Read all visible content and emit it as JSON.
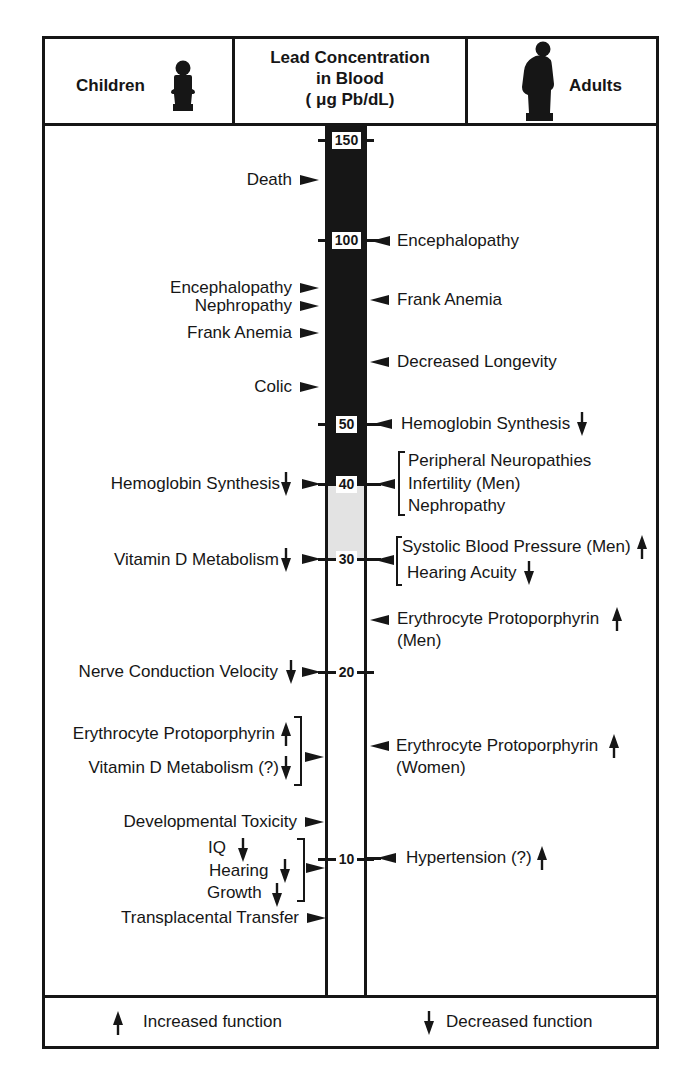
{
  "header": {
    "children_label": "Children",
    "title": [
      "Lead Concentration",
      "in Blood",
      "( μg Pb/dL)"
    ],
    "adults_label": "Adults",
    "children_icon": "child-figure-icon",
    "adults_icon": "adult-figure-icon"
  },
  "scale": {
    "unit": "μg Pb/dL",
    "ticks": [
      "150",
      "100",
      "50",
      "40",
      "30",
      "20",
      "10"
    ],
    "fill": {
      "black_range": "above 40",
      "gray_range": "30-40"
    }
  },
  "children": {
    "effects": [
      {
        "label": "Death",
        "function": "",
        "level_approx": 125
      },
      {
        "label": "Encephalopathy",
        "function": "",
        "level_approx": 85
      },
      {
        "label": "Nephropathy",
        "function": "",
        "level_approx": 80
      },
      {
        "label": "Frank Anemia",
        "function": "",
        "level_approx": 70
      },
      {
        "label": "Colic",
        "function": "",
        "level_approx": 60
      },
      {
        "label": "Hemoglobin Synthesis",
        "function": "decreased",
        "level_approx": 40
      },
      {
        "label": "Vitamin D Metabolism",
        "function": "decreased",
        "level_approx": 30
      },
      {
        "label": "Nerve Conduction Velocity",
        "function": "decreased",
        "level_approx": 20
      },
      {
        "label": "Erythrocyte Protoporphyrin",
        "function": "increased",
        "level_approx": 15,
        "group": 1
      },
      {
        "label": "Vitamin D Metabolism (?)",
        "function": "decreased",
        "level_approx": 15,
        "group": 1
      },
      {
        "label": "Developmental Toxicity",
        "function": "",
        "level_approx": 11
      },
      {
        "label": "IQ",
        "function": "decreased",
        "level_approx": 10,
        "group": 2
      },
      {
        "label": "Hearing",
        "function": "decreased",
        "level_approx": 10,
        "group": 2
      },
      {
        "label": "Growth",
        "function": "decreased",
        "level_approx": 10,
        "group": 2
      },
      {
        "label": "Transplacental Transfer",
        "function": "",
        "level_approx": 8
      }
    ]
  },
  "adults": {
    "effects": [
      {
        "label": "Encephalopathy",
        "function": "",
        "level_approx": 100
      },
      {
        "label": "Frank Anemia",
        "function": "",
        "level_approx": 80
      },
      {
        "label": "Decreased Longevity",
        "function": "",
        "level_approx": 60
      },
      {
        "label": "Hemoglobin Synthesis",
        "function": "decreased",
        "level_approx": 50
      },
      {
        "label": "Peripheral Neuropathies",
        "function": "",
        "level_approx": 40,
        "group": 1
      },
      {
        "label": "Infertility (Men)",
        "function": "",
        "level_approx": 40,
        "group": 1
      },
      {
        "label": "Nephropathy",
        "function": "",
        "level_approx": 40,
        "group": 1
      },
      {
        "label": "Systolic Blood Pressure (Men)",
        "function": "increased",
        "level_approx": 30,
        "group": 2
      },
      {
        "label": "Hearing Acuity",
        "function": "decreased",
        "level_approx": 30,
        "group": 2
      },
      {
        "label": "Erythrocyte Protoporphyrin",
        "sublabel": "(Men)",
        "function": "increased",
        "level_approx": 25
      },
      {
        "label": "Erythrocyte Protoporphyrin",
        "sublabel": "(Women)",
        "function": "increased",
        "level_approx": 15
      },
      {
        "label": "Hypertension (?)",
        "function": "increased",
        "level_approx": 10
      }
    ]
  },
  "legend": {
    "increased_label": "Increased function",
    "decreased_label": "Decreased function",
    "increased_icon": "up-arrow-icon",
    "decreased_icon": "down-arrow-icon"
  }
}
